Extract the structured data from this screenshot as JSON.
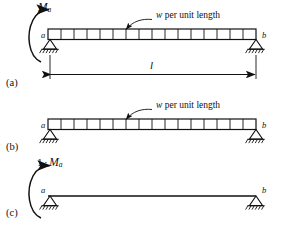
{
  "figure": {
    "type": "structural-beam-diagram",
    "ink_color": "#111111",
    "background_color": "#ffffff"
  },
  "panels": [
    {
      "tag": "(a)",
      "name": "beam-with-moment-and-load",
      "beam": {
        "left_node_label": "a",
        "right_node_label": "b",
        "load_cells": 16,
        "has_distributed_load_band": true
      },
      "moment": {
        "label_main": "M",
        "label_sub": "a",
        "direction": "counterclockwise-arrow-at-support-a"
      },
      "load_annotation": {
        "text_italic": "w",
        "text_rest": " per unit length",
        "leader": "curved-arrow-to-load-band"
      },
      "dimension": {
        "label": "l",
        "style": "double-headed-arrow",
        "spans": "support a to support b"
      }
    },
    {
      "tag": "(b)",
      "name": "beam-with-load-only",
      "beam": {
        "left_node_label": "a",
        "right_node_label": "b",
        "load_cells": 16,
        "has_distributed_load_band": true
      },
      "load_annotation": {
        "text_italic": "w",
        "text_rest": " per unit length",
        "leader": "curved-arrow-to-load-band"
      }
    },
    {
      "tag": "(c)",
      "name": "beam-with-unit-moment-only",
      "beam": {
        "left_node_label": "a",
        "right_node_label": "b",
        "load_cells": 0,
        "has_distributed_load_band": false
      },
      "moment": {
        "label_unit": "1",
        "label_dot": "·",
        "label_main": "M",
        "label_sub": "a",
        "direction": "counterclockwise-arrow-at-support-a"
      }
    }
  ],
  "supports": {
    "type": "pinned-triangle-with-ground-hatching",
    "count": 6
  }
}
